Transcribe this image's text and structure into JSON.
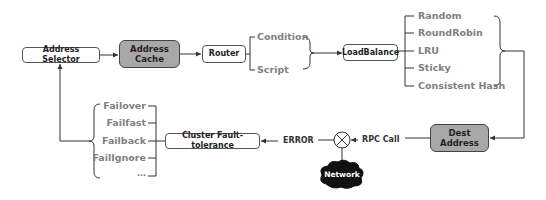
{
  "diagram": {
    "nodes": {
      "address_selector": "Address Selector",
      "address_cache": "Address\nCache",
      "router": "Router",
      "load_balance": "LoadBalance",
      "dest_address": "Dest\nAddress",
      "cluster_fault_tolerance": "Cluster Fault-tolerance",
      "network": "Network"
    },
    "router_options": [
      "Condition",
      "Script"
    ],
    "loadbalance_options": [
      "Random",
      "RoundRobin",
      "LRU",
      "Sticky",
      "Consistent Hash"
    ],
    "fault_tolerance_options": [
      "Failover",
      "Failfast",
      "Failback",
      "FailIgnore",
      "..."
    ],
    "edge_labels": {
      "rpc_call": "RPC Call",
      "error": "ERROR"
    },
    "colors": {
      "gray_node": "#a8a8a8",
      "line": "#333333",
      "option_text": "#808080",
      "network_cloud": "#111111"
    }
  }
}
